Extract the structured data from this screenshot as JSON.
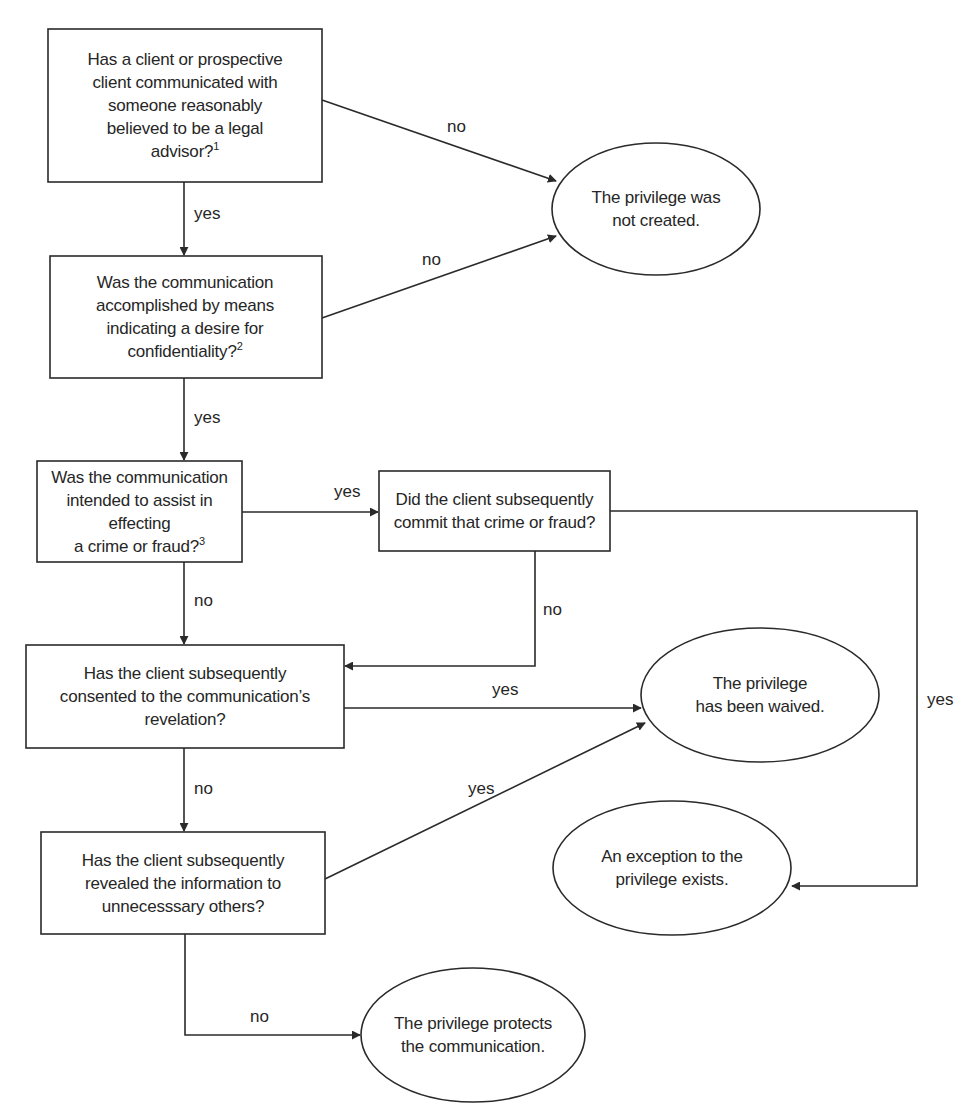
{
  "diagram": {
    "colors": {
      "stroke": "#2a2a2a",
      "text": "#262626",
      "background": "#ffffff"
    },
    "decisions": [
      {
        "id": "q1",
        "lines": "Has a client or prospective\nclient communicated with\nsomeone reasonably\nbelieved to be a legal\nadvisor?",
        "footnote": "1",
        "box": [
          48,
          29,
          174,
          153
        ]
      },
      {
        "id": "q2",
        "lines": "Was the communication\naccomplished by means\nindicating a desire for\nconfidentiality?",
        "footnote": "2",
        "box": [
          50,
          256,
          270,
          122
        ]
      },
      {
        "id": "q3",
        "lines": "Was the communication\nintended to assist in effecting\na crime or fraud?",
        "footnote": "3",
        "box": [
          37,
          461,
          205,
          101
        ]
      },
      {
        "id": "q4",
        "lines": "Did the client subsequently\ncommit that crime or fraud?",
        "footnote": "",
        "box": [
          379,
          471,
          231,
          80
        ]
      },
      {
        "id": "q5",
        "lines": "Has the client subsequently\nconsented to the communication’s\nrevelation?",
        "footnote": "",
        "box": [
          26,
          645,
          252,
          103
        ]
      },
      {
        "id": "q6",
        "lines": "Has the client subsequently\nrevealed the information to\nunnecesssary others?",
        "footnote": "",
        "box": [
          41,
          832,
          224,
          102
        ]
      }
    ],
    "outcomes": [
      {
        "id": "o1",
        "text": "The privilege was\nnot created.",
        "ellipse": [
          656,
          209,
          104,
          66
        ]
      },
      {
        "id": "o2",
        "text": "The privilege\nhas been waived.",
        "ellipse": [
          760,
          695,
          119,
          67
        ]
      },
      {
        "id": "o3",
        "text": "An exception to the\nprivilege exists.",
        "ellipse": [
          672,
          868,
          119,
          67
        ]
      },
      {
        "id": "o4",
        "text": "The privilege protects\nthe communication.",
        "ellipse": [
          473,
          1035,
          112,
          67
        ]
      }
    ],
    "edges": [
      {
        "from": "q1",
        "to": "o1",
        "label": "no",
        "label_pos": [
          455,
          120
        ]
      },
      {
        "from": "q1",
        "to": "q2",
        "label": "yes",
        "label_pos": [
          194,
          207
        ]
      },
      {
        "from": "q2",
        "to": "o1",
        "label": "no",
        "label_pos": [
          420,
          250
        ]
      },
      {
        "from": "q2",
        "to": "q3",
        "label": "yes",
        "label_pos": [
          194,
          410
        ]
      },
      {
        "from": "q3",
        "to": "q4",
        "label": "yes",
        "label_pos": [
          336,
          482
        ]
      },
      {
        "from": "q3",
        "to": "q5",
        "label": "no",
        "label_pos": [
          194,
          595
        ]
      },
      {
        "from": "q4",
        "to": "q5",
        "label": "no",
        "label_pos": [
          542,
          601
        ]
      },
      {
        "from": "q4",
        "to": "o3",
        "label": "yes",
        "label_pos": [
          926,
          700
        ]
      },
      {
        "from": "q5",
        "to": "o2",
        "label": "yes",
        "label_pos": [
          491,
          680
        ]
      },
      {
        "from": "q5",
        "to": "q6",
        "label": "no",
        "label_pos": [
          194,
          782
        ]
      },
      {
        "from": "q6",
        "to": "o2",
        "label": "yes",
        "label_pos": [
          476,
          782
        ]
      },
      {
        "from": "q6",
        "to": "o4",
        "label": "no",
        "label_pos": [
          250,
          1006
        ]
      }
    ]
  }
}
